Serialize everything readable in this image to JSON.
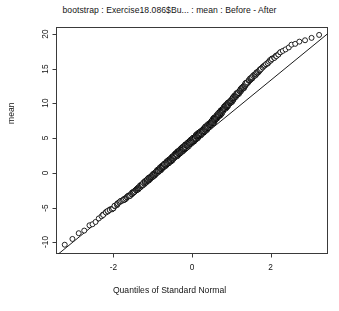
{
  "chart_data": {
    "type": "scatter",
    "title": "bootstrap : Exercise18.086$Bu... : mean : Before - After",
    "xlabel": "Quantiles of Standard Normal",
    "ylabel": "mean",
    "xlim": [
      -3.45,
      3.45
    ],
    "ylim": [
      -11.6,
      20.9
    ],
    "xticks": [
      -2,
      0,
      2
    ],
    "xtick_labels": [
      "-2",
      "0",
      "2"
    ],
    "yticks": [
      20,
      15,
      10,
      5,
      0,
      -5,
      -10
    ],
    "ytick_labels": [
      "20",
      "15",
      "10",
      "5",
      "0",
      "-5",
      "-10"
    ],
    "grid": false,
    "legend": null,
    "marker": "open-circle",
    "marker_size_px": 5,
    "reference_line": {
      "present": true,
      "intercept": 4.05,
      "slope": 4.62,
      "color": "#000000"
    },
    "n_points": 1000,
    "series": [
      {
        "name": "bootstrap means",
        "description": "Normal Q-Q plot of 1000 bootstrap replicate means of Before - After; points follow the reference line closely with slight waviness in the tails.",
        "x": [
          -3.24,
          -3.05,
          -2.88,
          -2.74,
          -2.62,
          -2.54,
          -2.46,
          -2.38,
          -2.31,
          -2.25,
          -2.19,
          -2.14,
          -2.09,
          -2.04,
          -2.0,
          -1.96,
          -1.92,
          -1.88,
          -1.84,
          -1.81,
          -1.77,
          -1.74,
          -1.71,
          -1.68,
          -1.65,
          -1.62,
          -1.6,
          -1.57,
          -1.54,
          -1.52,
          -1.49,
          -1.47,
          -1.45,
          -1.42,
          -1.4,
          -1.38,
          -1.36,
          -1.34,
          -1.32,
          -1.3,
          -1.28,
          -1.26,
          -1.24,
          -1.22,
          -1.2,
          -1.18,
          -1.17,
          -1.15,
          -1.13,
          -1.11,
          -1.1,
          -1.08,
          -1.06,
          -1.05,
          -1.03,
          -1.02,
          -1.0,
          -0.99,
          -0.97,
          -0.96,
          -0.94,
          -0.93,
          -0.91,
          -0.9,
          -0.88,
          -0.87,
          -0.86,
          -0.84,
          -0.83,
          -0.82,
          -0.8,
          -0.79,
          -0.78,
          -0.76,
          -0.75,
          -0.74,
          -0.73,
          -0.71,
          -0.7,
          -0.69,
          -0.68,
          -0.67,
          -0.65,
          -0.64,
          -0.63,
          -0.62,
          -0.61,
          -0.6,
          -0.58,
          -0.57,
          -0.56,
          -0.55,
          -0.54,
          -0.53,
          -0.52,
          -0.51,
          -0.5,
          -0.48,
          -0.47,
          -0.46,
          -0.45,
          -0.44,
          -0.43,
          -0.42,
          -0.41,
          -0.4,
          -0.39,
          -0.38,
          -0.37,
          -0.36,
          -0.35,
          -0.34,
          -0.33,
          -0.32,
          -0.31,
          -0.3,
          -0.29,
          -0.28,
          -0.27,
          -0.26,
          -0.25,
          -0.24,
          -0.23,
          -0.22,
          -0.21,
          -0.2,
          -0.19,
          -0.18,
          -0.17,
          -0.16,
          -0.15,
          -0.14,
          -0.13,
          -0.12,
          -0.11,
          -0.1,
          -0.09,
          -0.08,
          -0.07,
          -0.06,
          -0.05,
          -0.04,
          -0.03,
          -0.02,
          -0.01,
          0.0,
          0.01,
          0.02,
          0.03,
          0.04,
          0.05,
          0.06,
          0.07,
          0.08,
          0.09,
          0.1,
          0.11,
          0.12,
          0.13,
          0.14,
          0.15,
          0.16,
          0.17,
          0.18,
          0.19,
          0.2,
          0.21,
          0.22,
          0.23,
          0.24,
          0.25,
          0.26,
          0.27,
          0.28,
          0.29,
          0.3,
          0.31,
          0.32,
          0.33,
          0.34,
          0.35,
          0.36,
          0.37,
          0.38,
          0.39,
          0.4,
          0.41,
          0.42,
          0.43,
          0.44,
          0.45,
          0.46,
          0.47,
          0.48,
          0.5,
          0.51,
          0.52,
          0.53,
          0.54,
          0.55,
          0.56,
          0.57,
          0.58,
          0.6,
          0.61,
          0.62,
          0.63,
          0.64,
          0.65,
          0.67,
          0.68,
          0.69,
          0.7,
          0.71,
          0.73,
          0.74,
          0.75,
          0.76,
          0.78,
          0.79,
          0.8,
          0.82,
          0.83,
          0.84,
          0.86,
          0.87,
          0.88,
          0.9,
          0.91,
          0.93,
          0.94,
          0.96,
          0.97,
          0.99,
          1.0,
          1.02,
          1.03,
          1.05,
          1.06,
          1.08,
          1.1,
          1.11,
          1.13,
          1.15,
          1.17,
          1.18,
          1.2,
          1.22,
          1.24,
          1.26,
          1.28,
          1.3,
          1.32,
          1.34,
          1.36,
          1.38,
          1.4,
          1.42,
          1.45,
          1.47,
          1.49,
          1.52,
          1.54,
          1.57,
          1.6,
          1.62,
          1.65,
          1.68,
          1.71,
          1.74,
          1.77,
          1.81,
          1.84,
          1.88,
          1.92,
          1.96,
          2.0,
          2.04,
          2.09,
          2.14,
          2.19,
          2.25,
          2.31,
          2.38,
          2.46,
          2.54,
          2.62,
          2.74,
          2.88,
          3.05,
          3.24
        ],
        "y": [
          -10.3,
          -9.5,
          -8.7,
          -8.3,
          -7.6,
          -7.4,
          -7.1,
          -6.6,
          -6.2,
          -6.0,
          -5.7,
          -5.5,
          -5.3,
          -5.2,
          -5.1,
          -4.8,
          -4.6,
          -4.4,
          -4.2,
          -4.1,
          -4.0,
          -3.9,
          -3.8,
          -3.6,
          -3.5,
          -3.4,
          -3.3,
          -3.2,
          -3.0,
          -2.9,
          -2.8,
          -2.7,
          -2.6,
          -2.5,
          -2.4,
          -2.3,
          -2.2,
          -2.1,
          -2.0,
          -1.9,
          -1.8,
          -1.7,
          -1.6,
          -1.5,
          -1.4,
          -1.3,
          -1.25,
          -1.15,
          -1.05,
          -0.95,
          -0.9,
          -0.8,
          -0.7,
          -0.65,
          -0.55,
          -0.5,
          -0.4,
          -0.35,
          -0.25,
          -0.2,
          -0.1,
          -0.05,
          0.05,
          0.1,
          0.2,
          0.25,
          0.3,
          0.4,
          0.45,
          0.5,
          0.6,
          0.65,
          0.7,
          0.8,
          0.85,
          0.9,
          0.95,
          1.05,
          1.1,
          1.15,
          1.2,
          1.25,
          1.35,
          1.4,
          1.45,
          1.5,
          1.55,
          1.6,
          1.7,
          1.75,
          1.8,
          1.85,
          1.9,
          1.95,
          2.0,
          2.05,
          2.1,
          2.2,
          2.25,
          2.3,
          2.35,
          2.4,
          2.45,
          2.5,
          2.55,
          2.6,
          2.65,
          2.7,
          2.75,
          2.8,
          2.85,
          2.9,
          2.95,
          3.0,
          3.05,
          3.1,
          3.15,
          3.2,
          3.25,
          3.3,
          3.35,
          3.4,
          3.45,
          3.5,
          3.55,
          3.6,
          3.65,
          3.7,
          3.75,
          3.8,
          3.85,
          3.9,
          3.95,
          4.0,
          4.05,
          4.1,
          4.15,
          4.2,
          4.25,
          4.3,
          4.35,
          4.4,
          4.45,
          4.5,
          4.55,
          4.6,
          4.65,
          4.7,
          4.75,
          4.8,
          4.85,
          4.9,
          4.95,
          5.0,
          5.05,
          5.1,
          5.15,
          5.2,
          5.25,
          5.3,
          5.35,
          5.4,
          5.45,
          5.5,
          5.55,
          5.6,
          5.65,
          5.7,
          5.75,
          5.8,
          5.85,
          5.9,
          5.95,
          6.0,
          6.05,
          6.1,
          6.15,
          6.2,
          6.25,
          6.3,
          6.35,
          6.4,
          6.45,
          6.5,
          6.6,
          6.65,
          6.7,
          6.75,
          6.8,
          6.85,
          6.9,
          7.0,
          7.05,
          7.1,
          7.2,
          7.25,
          7.3,
          7.4,
          7.45,
          7.5,
          7.6,
          7.65,
          7.7,
          7.8,
          7.85,
          7.95,
          8.0,
          8.05,
          8.15,
          8.25,
          8.3,
          8.4,
          8.45,
          8.55,
          8.65,
          8.7,
          8.8,
          8.85,
          8.95,
          9.05,
          9.1,
          9.2,
          9.3,
          9.35,
          9.45,
          9.55,
          9.6,
          9.7,
          9.8,
          9.9,
          10.0,
          10.1,
          10.2,
          10.3,
          10.4,
          10.5,
          10.6,
          10.7,
          10.8,
          10.9,
          11.0,
          11.1,
          11.2,
          11.35,
          11.45,
          11.55,
          11.65,
          11.8,
          11.9,
          12.0,
          12.15,
          12.25,
          12.4,
          12.5,
          12.65,
          12.8,
          12.9,
          13.05,
          13.2,
          13.35,
          13.5,
          13.6,
          13.75,
          13.9,
          14.05,
          14.2,
          14.35,
          14.5,
          14.7,
          14.85,
          15.0,
          15.2,
          15.4,
          15.6,
          15.8,
          16.0,
          16.2,
          16.4,
          16.6,
          16.8,
          17.0,
          17.3,
          17.5,
          17.8,
          18.0,
          18.4,
          18.6,
          18.9,
          19.1,
          19.4,
          19.8
        ]
      }
    ]
  },
  "axes": {
    "x_tick_values": [
      -2,
      0,
      2
    ],
    "x_tick_labels": [
      "-2",
      "0",
      "2"
    ],
    "y_tick_values": [
      20,
      15,
      10,
      5,
      0,
      -5,
      -10
    ],
    "y_tick_labels": [
      "20",
      "15",
      "10",
      "5",
      "0",
      "-5",
      "-10"
    ]
  },
  "colors": {
    "background": "#ffffff",
    "foreground": "#141414",
    "frame": "#3a3a3a",
    "point_stroke": "#000000",
    "point_fill": "#ffffff",
    "line": "#000000"
  }
}
